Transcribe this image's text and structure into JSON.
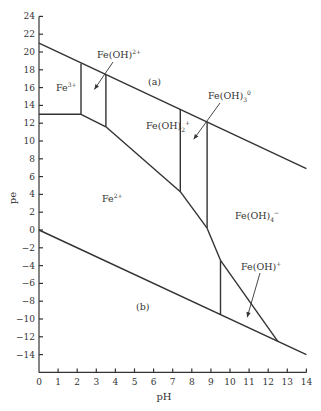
{
  "chart_data": {
    "type": "line",
    "title": "",
    "xlabel": "pH",
    "ylabel": "pe",
    "xlim": [
      0,
      14
    ],
    "ylim": [
      -16,
      24
    ],
    "xticks": [
      0,
      1,
      2,
      3,
      4,
      5,
      6,
      7,
      8,
      9,
      10,
      11,
      12,
      13,
      14
    ],
    "yticks": [
      -14,
      -12,
      -10,
      -8,
      -6,
      -4,
      -2,
      0,
      2,
      4,
      6,
      8,
      10,
      12,
      14,
      16,
      18,
      20,
      22,
      24
    ],
    "grid": false,
    "series": [
      {
        "name": "(a) upper water stability limit",
        "x": [
          0,
          14
        ],
        "y": [
          21,
          6.9
        ]
      },
      {
        "name": "(b) lower water stability limit",
        "x": [
          0,
          14
        ],
        "y": [
          0,
          -14
        ]
      },
      {
        "name": "Fe3+/Fe2+ boundary",
        "x": [
          0,
          2.2
        ],
        "y": [
          13,
          13
        ]
      },
      {
        "name": "Fe(OH)2+ / Fe2+ boundary",
        "x": [
          2.2,
          3.5
        ],
        "y": [
          13,
          11.6
        ]
      },
      {
        "name": "Fe(OH)2+ / Fe2+ boundary",
        "x": [
          3.5,
          7.4
        ],
        "y": [
          11.6,
          4.3
        ]
      },
      {
        "name": "Fe(OH)3(0) / Fe2+ boundary",
        "x": [
          7.4,
          8.8
        ],
        "y": [
          4.3,
          0.2
        ]
      },
      {
        "name": "Fe(OH)4- / Fe2+ boundary",
        "x": [
          8.8,
          9.5
        ],
        "y": [
          0.2,
          -3.4
        ]
      },
      {
        "name": "Fe(OH)4- / Fe(OH)+ boundary",
        "x": [
          9.5,
          12.5
        ],
        "y": [
          -3.4,
          -12.5
        ]
      },
      {
        "name": "Fe3+ / Fe(OH)2+ vertical",
        "x": [
          2.2,
          2.2
        ],
        "y": [
          18.7,
          13
        ]
      },
      {
        "name": "Fe(OH)2+ / Fe(OH)2+ vertical",
        "x": [
          3.5,
          3.5
        ],
        "y": [
          17.4,
          11.6
        ]
      },
      {
        "name": "Fe(OH)2+ / Fe(OH)3 vertical",
        "x": [
          7.4,
          7.4
        ],
        "y": [
          13.6,
          4.3
        ]
      },
      {
        "name": "Fe(OH)3 / Fe(OH)4- vertical",
        "x": [
          8.8,
          8.8
        ],
        "y": [
          12.2,
          0.2
        ]
      },
      {
        "name": "Fe2+ / Fe(OH)+ vertical",
        "x": [
          9.5,
          9.5
        ],
        "y": [
          -3.4,
          -9.5
        ]
      }
    ],
    "annotations": [
      {
        "text": "Fe³⁺",
        "x": 0.9,
        "y": 15.8
      },
      {
        "text": "Fe(OH)²⁺",
        "x": 4.2,
        "y": 19.7,
        "arrow_to": [
          2.9,
          15.8
        ]
      },
      {
        "text": "(a)",
        "x": 5.7,
        "y": 16.8
      },
      {
        "text": "Fe(OH)₂⁺",
        "x": 5.8,
        "y": 11.8
      },
      {
        "text": "Fe(OH)₃⁰",
        "x": 9.3,
        "y": 13.6,
        "arrow_to": [
          8.1,
          10.2
        ]
      },
      {
        "text": "Fe²⁺",
        "x": 3.5,
        "y": 3.5
      },
      {
        "text": "Fe(OH)₄⁻",
        "x": 11.4,
        "y": -0.6
      },
      {
        "text": "Fe(OH)⁺",
        "x": 11.6,
        "y": -6.3,
        "arrow_to": [
          10.9,
          -9.8
        ]
      },
      {
        "text": "(b)",
        "x": 5.2,
        "y": -8.5
      }
    ]
  },
  "labels": {
    "xlabel": "pH",
    "ylabel": "pe",
    "fe3": "Fe",
    "fe3_sup": "3+",
    "feoh2p": "Fe(OH)",
    "feoh2p_sup": "2+",
    "a": "(a)",
    "feoh2": "Fe(OH)",
    "feoh2_sub": "2",
    "feoh2_sup": "+",
    "feoh3": "Fe(OH)",
    "feoh3_sub": "3",
    "feoh3_sup": "0",
    "fe2": "Fe",
    "fe2_sup": "2+",
    "feoh4": "Fe(OH)",
    "feoh4_sub": "4",
    "feoh4_sup": "−",
    "feohp": "Fe(OH)",
    "feohp_sup": "+",
    "b": "(b)"
  }
}
